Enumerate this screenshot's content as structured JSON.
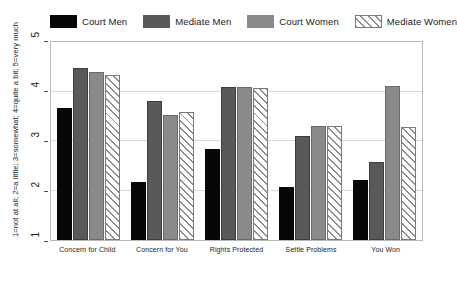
{
  "chart_data": {
    "type": "bar",
    "title": "",
    "xlabel": "",
    "ylabel": "1=not at all; 2=a little; 3=somewhat; 4=quite a bit; 5=very much",
    "ylim": [
      1,
      5
    ],
    "yticks": [
      "1",
      "2",
      "3",
      "4",
      "5"
    ],
    "grid": true,
    "legend_position": "top",
    "categories": [
      "Concern for Child",
      "Concern for You",
      "Rights Protected",
      "Settle Problems",
      "You Won"
    ],
    "series": [
      {
        "name": "Court Men",
        "color": "#070707",
        "pattern": "solid",
        "values": [
          3.67,
          2.18,
          2.83,
          2.07,
          2.22
        ]
      },
      {
        "name": "Mediate Men",
        "color": "#595959",
        "pattern": "solid",
        "values": [
          4.48,
          3.8,
          4.1,
          3.1,
          2.58
        ]
      },
      {
        "name": "Court Women",
        "color": "#8a8a8a",
        "pattern": "solid",
        "values": [
          4.4,
          3.52,
          4.1,
          3.3,
          4.12
        ]
      },
      {
        "name": "Mediate Women",
        "color": "#ffffff",
        "pattern": "hatch",
        "values": [
          4.33,
          3.58,
          4.08,
          3.3,
          3.28
        ]
      }
    ]
  }
}
